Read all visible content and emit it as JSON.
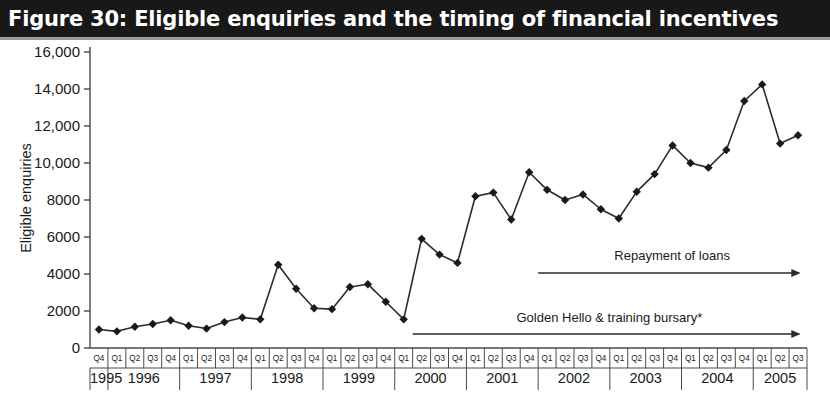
{
  "figure": {
    "title": "Figure 30: Eligible enquiries and the timing of financial incentives",
    "source_note": "TDA"
  },
  "colors": {
    "title_bar_bg": "#181818",
    "title_text": "#ffffff",
    "line": "#2b2b2b",
    "marker": "#1a1a1a",
    "axis": "#4a4a4a",
    "text": "#1a1a1a"
  },
  "chart_data": {
    "type": "line",
    "title": "Figure 30: Eligible enquiries and the timing of financial incentives",
    "xlabel": "",
    "ylabel": "Eligible enquiries",
    "ylim": [
      0,
      16000
    ],
    "ytick_labels": [
      "16,000",
      "14,000",
      "12,000",
      "10,000",
      "8000",
      "6000",
      "4000",
      "2000",
      "0"
    ],
    "ytick_values": [
      16000,
      14000,
      12000,
      10000,
      8000,
      6000,
      4000,
      2000,
      0
    ],
    "grid": false,
    "legend": "none",
    "years": [
      {
        "year": "1995",
        "quarters": [
          "Q4"
        ]
      },
      {
        "year": "1996",
        "quarters": [
          "Q1",
          "Q2",
          "Q3",
          "Q4"
        ]
      },
      {
        "year": "1997",
        "quarters": [
          "Q1",
          "Q2",
          "Q3",
          "Q4"
        ]
      },
      {
        "year": "1998",
        "quarters": [
          "Q1",
          "Q2",
          "Q3",
          "Q4"
        ]
      },
      {
        "year": "1999",
        "quarters": [
          "Q1",
          "Q2",
          "Q3",
          "Q4"
        ]
      },
      {
        "year": "2000",
        "quarters": [
          "Q1",
          "Q2",
          "Q3",
          "Q4"
        ]
      },
      {
        "year": "2001",
        "quarters": [
          "Q1",
          "Q2",
          "Q3",
          "Q4"
        ]
      },
      {
        "year": "2002",
        "quarters": [
          "Q1",
          "Q2",
          "Q3",
          "Q4"
        ]
      },
      {
        "year": "2003",
        "quarters": [
          "Q1",
          "Q2",
          "Q3",
          "Q4"
        ]
      },
      {
        "year": "2004",
        "quarters": [
          "Q1",
          "Q2",
          "Q3",
          "Q4"
        ]
      },
      {
        "year": "2005",
        "quarters": [
          "Q1",
          "Q2",
          "Q3"
        ]
      }
    ],
    "categories": [
      "1995 Q4",
      "1996 Q1",
      "1996 Q2",
      "1996 Q3",
      "1996 Q4",
      "1997 Q1",
      "1997 Q2",
      "1997 Q3",
      "1997 Q4",
      "1998 Q1",
      "1998 Q2",
      "1998 Q3",
      "1998 Q4",
      "1999 Q1",
      "1999 Q2",
      "1999 Q3",
      "1999 Q4",
      "2000 Q1",
      "2000 Q2",
      "2000 Q3",
      "2000 Q4",
      "2001 Q1",
      "2001 Q2",
      "2001 Q3",
      "2001 Q4",
      "2002 Q1",
      "2002 Q2",
      "2002 Q3",
      "2002 Q4",
      "2003 Q1",
      "2003 Q2",
      "2003 Q3",
      "2003 Q4",
      "2004 Q1",
      "2004 Q2",
      "2004 Q3",
      "2004 Q4",
      "2005 Q1",
      "2005 Q2",
      "2005 Q3"
    ],
    "values": [
      1000,
      900,
      1150,
      1300,
      1500,
      1200,
      1050,
      1400,
      1650,
      1550,
      4500,
      3200,
      2150,
      2100,
      3300,
      3450,
      2500,
      1550,
      5900,
      5050,
      4600,
      8200,
      8400,
      6950,
      9500,
      8550,
      8000,
      8300,
      7500,
      7000,
      8450,
      9400,
      10950,
      10000,
      9750,
      10700,
      13350,
      14250,
      11050,
      11500
    ],
    "annotations": [
      {
        "id": "repayment-of-loans",
        "label": "Repayment of loans",
        "start_category": "2002 Q1",
        "end_category": "2005 Q3",
        "arrow": "right"
      },
      {
        "id": "golden-hello",
        "label": "Golden Hello & training bursary*",
        "start_category": "2000 Q2",
        "end_category": "2005 Q3",
        "arrow": "right"
      }
    ]
  }
}
